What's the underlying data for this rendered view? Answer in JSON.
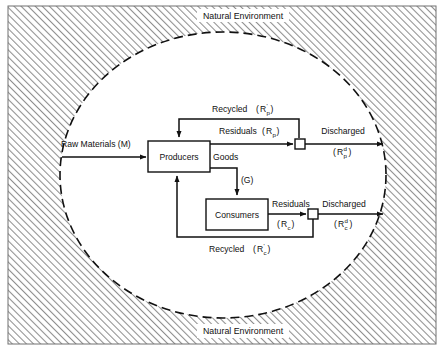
{
  "figure": {
    "type": "flow-diagram",
    "title_top": "Natural Environment",
    "title_bottom": "Natural Environment",
    "background_fill": "hatched-diagonal-gray",
    "boundary_shape": "dashed-ellipse",
    "colors": {
      "line": "#111111",
      "hatch": "#9a9a9a",
      "paper": "#ffffff",
      "frame": "#6f6f6f"
    }
  },
  "nodes": [
    {
      "id": "producers",
      "label": "Producers"
    },
    {
      "id": "consumers",
      "label": "Consumers"
    },
    {
      "id": "junction_p",
      "label": ""
    },
    {
      "id": "junction_c",
      "label": ""
    }
  ],
  "flows": {
    "raw_materials": {
      "label": "Raw Materials",
      "symbol": "(M)",
      "full": "Raw Materials (M)"
    },
    "recycled_producers": {
      "label": "Recycled",
      "symbol_base": "R",
      "symbol_prime": "'",
      "symbol_sub": "p",
      "full": "Recycled (R'p)"
    },
    "residuals_producers": {
      "label": "Residuals",
      "symbol_base": "R",
      "symbol_sub": "p",
      "full": "Residuals (Rp)"
    },
    "discharged_producers": {
      "label": "Discharged",
      "symbol_base": "R",
      "symbol_sub": "p",
      "symbol_sup": "d",
      "full": "Discharged (Rpd)"
    },
    "goods": {
      "label": "Goods",
      "symbol": "(G)",
      "full": "Goods (G)"
    },
    "residuals_consumers": {
      "label": "Residuals",
      "symbol_base": "R",
      "symbol_sub": "c",
      "full": "Residuals (Rc)"
    },
    "discharged_consumers": {
      "label": "Discharged",
      "symbol_base": "R",
      "symbol_sub": "c",
      "symbol_sup": "d",
      "full": "Discharged (Rcd)"
    },
    "recycled_consumers": {
      "label": "Recycled",
      "symbol_base": "R",
      "symbol_prime": "'",
      "symbol_sub": "c",
      "full": "Recycled (R'c)"
    }
  },
  "punctuation": {
    "open_paren": "(",
    "close_paren": ")"
  }
}
